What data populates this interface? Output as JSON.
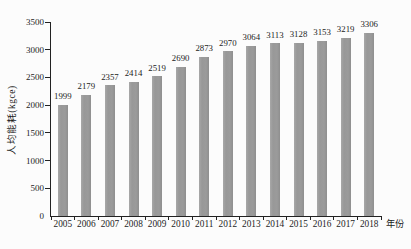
{
  "chart_data": {
    "type": "bar",
    "title": "",
    "xlabel": "年份",
    "ylabel": "人均能耗(kgce)",
    "categories": [
      "2005",
      "2006",
      "2007",
      "2008",
      "2009",
      "2010",
      "2011",
      "2012",
      "2013",
      "2014",
      "2015",
      "2016",
      "2017",
      "2018"
    ],
    "values": [
      1999,
      2179,
      2357,
      2414,
      2519,
      2690,
      2873,
      2970,
      3064,
      3113,
      3128,
      3153,
      3219,
      3306
    ],
    "data_labels_shown": true,
    "ylim": [
      0,
      3500
    ],
    "yticks": [
      0,
      500,
      1000,
      1500,
      2000,
      2500,
      3000,
      3500
    ],
    "grid": false,
    "legend_position": "none",
    "bar_color": "#9b9b9b",
    "axis_color": "#222222",
    "background_color": "#fcfcfc"
  }
}
